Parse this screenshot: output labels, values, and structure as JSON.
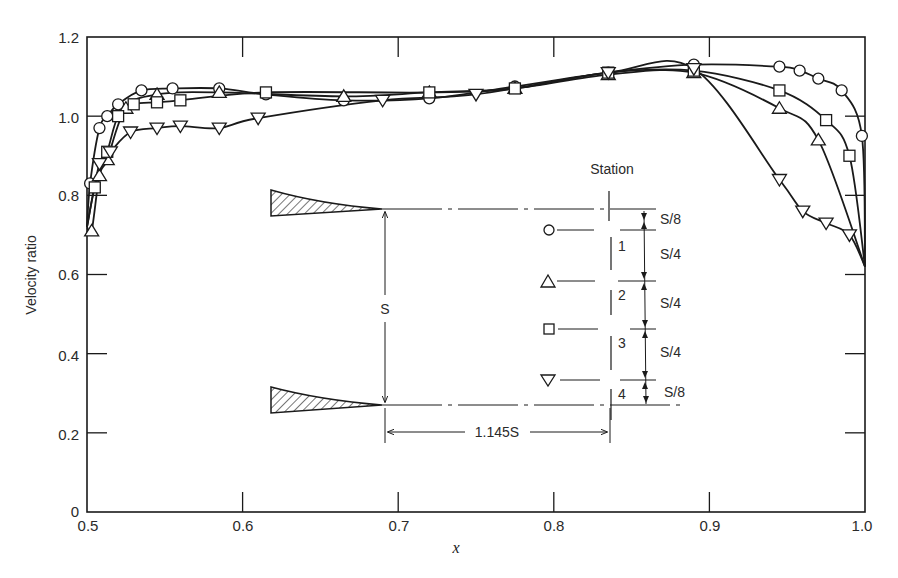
{
  "chart_data": {
    "type": "line",
    "title": "",
    "xlabel": "x",
    "ylabel": "Velocity ratio",
    "xlim": [
      0.5,
      1.0
    ],
    "ylim": [
      0,
      1.2
    ],
    "x_ticks": [
      "0.5",
      "0.6",
      "0.7",
      "0.8",
      "0.9",
      "1.0"
    ],
    "y_ticks": [
      "0",
      "0.2",
      "0.4",
      "0.6",
      "0.8",
      "1.0",
      "1.2"
    ],
    "grid": false,
    "legend_position": "inset diagram (right-center)",
    "series": [
      {
        "name": "Station 1",
        "marker": "circle",
        "points": [
          [
            0.502,
            0.83
          ],
          [
            0.508,
            0.97
          ],
          [
            0.513,
            1.0
          ],
          [
            0.52,
            1.03
          ],
          [
            0.535,
            1.065
          ],
          [
            0.555,
            1.07
          ],
          [
            0.585,
            1.07
          ],
          [
            0.615,
            1.055
          ],
          [
            0.665,
            1.04
          ],
          [
            0.72,
            1.045
          ],
          [
            0.775,
            1.075
          ],
          [
            0.835,
            1.11
          ],
          [
            0.89,
            1.13
          ],
          [
            0.945,
            1.125
          ],
          [
            0.958,
            1.115
          ],
          [
            0.97,
            1.095
          ],
          [
            0.985,
            1.065
          ],
          [
            0.998,
            0.95
          ]
        ],
        "curve_end": [
          1.0,
          0.62
        ]
      },
      {
        "name": "Station 2",
        "marker": "triangle-up",
        "points": [
          [
            0.503,
            0.71
          ],
          [
            0.508,
            0.85
          ],
          [
            0.513,
            0.89
          ],
          [
            0.525,
            1.02
          ],
          [
            0.545,
            1.055
          ],
          [
            0.585,
            1.06
          ],
          [
            0.665,
            1.05
          ],
          [
            0.72,
            1.06
          ],
          [
            0.775,
            1.07
          ],
          [
            0.835,
            1.105
          ],
          [
            0.89,
            1.11
          ],
          [
            0.945,
            1.02
          ],
          [
            0.97,
            0.94
          ]
        ],
        "curve_end": [
          1.0,
          0.62
        ]
      },
      {
        "name": "Station 3",
        "marker": "square",
        "points": [
          [
            0.505,
            0.82
          ],
          [
            0.513,
            0.91
          ],
          [
            0.52,
            1.0
          ],
          [
            0.53,
            1.03
          ],
          [
            0.545,
            1.035
          ],
          [
            0.56,
            1.04
          ],
          [
            0.615,
            1.06
          ],
          [
            0.72,
            1.06
          ],
          [
            0.775,
            1.07
          ],
          [
            0.835,
            1.11
          ],
          [
            0.89,
            1.115
          ],
          [
            0.945,
            1.065
          ],
          [
            0.975,
            0.99
          ],
          [
            0.99,
            0.9
          ]
        ],
        "curve_end": [
          1.0,
          0.62
        ]
      },
      {
        "name": "Station 4",
        "marker": "triangle-down",
        "points": [
          [
            0.508,
            0.88
          ],
          [
            0.515,
            0.91
          ],
          [
            0.528,
            0.96
          ],
          [
            0.545,
            0.97
          ],
          [
            0.56,
            0.975
          ],
          [
            0.585,
            0.97
          ],
          [
            0.61,
            0.995
          ],
          [
            0.69,
            1.04
          ],
          [
            0.75,
            1.055
          ],
          [
            0.835,
            1.11
          ],
          [
            0.89,
            1.12
          ],
          [
            0.945,
            0.84
          ],
          [
            0.96,
            0.76
          ],
          [
            0.975,
            0.73
          ],
          [
            0.99,
            0.7
          ]
        ],
        "curve_end": [
          1.0,
          0.62
        ]
      }
    ],
    "annotations": {
      "inset_title": "Station",
      "spacing_labels": [
        "S/8",
        "S/4",
        "S/4",
        "S/4",
        "S/8"
      ],
      "station_numbers": [
        "1",
        "2",
        "3",
        "4"
      ],
      "pitch_label": "S",
      "axial_distance_label": "1.145S"
    }
  },
  "axes": {
    "x_tick_labels": [
      "0.5",
      "0.6",
      "0.7",
      "0.8",
      "0.9",
      "1.0"
    ],
    "y_tick_labels": [
      "0",
      "0.2",
      "0.4",
      "0.6",
      "0.8",
      "1.0",
      "1.2"
    ],
    "x_title": "x",
    "y_title": "Velocity ratio"
  },
  "inset": {
    "title": "Station",
    "stations": [
      {
        "number": "1",
        "marker": "circle"
      },
      {
        "number": "2",
        "marker": "triangle-up"
      },
      {
        "number": "3",
        "marker": "square"
      },
      {
        "number": "4",
        "marker": "triangle-down"
      }
    ],
    "spacing": [
      "S/8",
      "S/4",
      "S/4",
      "S/4",
      "S/8"
    ],
    "pitch": "S",
    "distance": "1.145S"
  },
  "colors": {
    "ink": "#1a1a1a",
    "background": "#ffffff"
  }
}
